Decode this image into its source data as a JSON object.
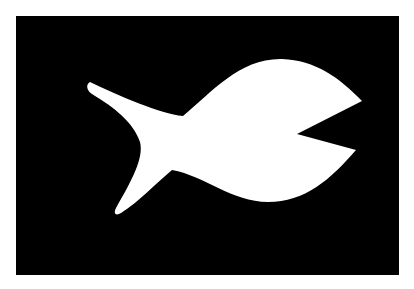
{
  "image": {
    "description": "White fish silhouette on black rectangle",
    "background_color": "#ffffff",
    "panel_color": "#000000",
    "shape_color": "#ffffff"
  },
  "fish": {
    "label": "fish-silhouette"
  }
}
